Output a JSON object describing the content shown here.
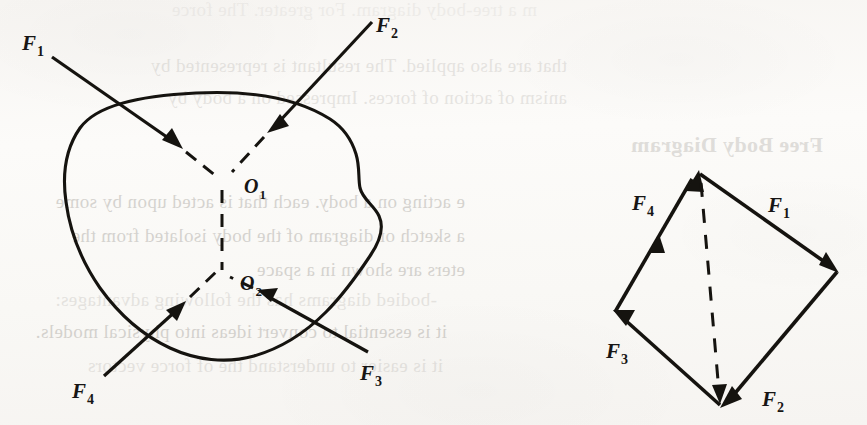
{
  "figure": {
    "kind": "physics-force-diagram",
    "panels": [
      {
        "id": "rigid-body-panel",
        "name": "non-concurrent-force-system-on-rigid-body",
        "description": "Irregular rigid body acted on by four forces meeting at two points of concurrence",
        "concurrence_points": [
          {
            "label": "O",
            "sub": "1",
            "x": 222,
            "y": 183
          },
          {
            "label": "O",
            "sub": "2",
            "x": 222,
            "y": 277
          }
        ],
        "forces": [
          {
            "label": "F",
            "sub": "1",
            "tail": [
              52,
              57
            ],
            "tip": [
              178,
              145
            ],
            "meets": "O1",
            "label_xy": [
              22,
              50
            ]
          },
          {
            "label": "F",
            "sub": "2",
            "tail": [
              372,
              22
            ],
            "tip": [
              270,
              130
            ],
            "meets": "O1",
            "label_xy": [
              376,
              32
            ]
          },
          {
            "label": "F",
            "sub": "3",
            "tail": [
              368,
              352
            ],
            "tip": [
              262,
              292
            ],
            "meets": "O2",
            "label_xy": [
              360,
              380
            ]
          },
          {
            "label": "F",
            "sub": "4",
            "tail": [
              104,
              376
            ],
            "tip": [
              182,
              305
            ],
            "meets": "O2",
            "label_xy": [
              72,
              398
            ]
          }
        ],
        "connector": {
          "style": "dashed",
          "from": "O1",
          "to": "O2"
        }
      },
      {
        "id": "force-polygon-panel",
        "name": "free-body-force-polygon",
        "description": "Closed force polygon formed by the same four force vectors placed tip to tail",
        "vertices": {
          "top": [
            698,
            172
          ],
          "right": [
            837,
            272
          ],
          "bottom": [
            720,
            405
          ],
          "left": [
            615,
            312
          ]
        },
        "forces": [
          {
            "label": "F",
            "sub": "1",
            "from": "top",
            "to": "right",
            "label_xy": [
              768,
              212
            ]
          },
          {
            "label": "F",
            "sub": "2",
            "from": "right",
            "to": "bottom",
            "label_xy": [
              762,
              406
            ]
          },
          {
            "label": "F",
            "sub": "3",
            "from": "bottom",
            "to": "left",
            "label_xy": [
              608,
              358
            ]
          },
          {
            "label": "F",
            "sub": "4",
            "from": "left",
            "to": "top",
            "label_xy": [
              634,
              210
            ]
          }
        ],
        "resultant": {
          "style": "dashed",
          "from": "top",
          "to": "bottom",
          "label": ""
        }
      }
    ],
    "colors": {
      "ink": "#15130f",
      "paper": "#fbfaf8",
      "bleed_text": "#9e9a94"
    }
  },
  "bleed_through_text": {
    "note": "faint mirrored text showing through from the reverse page",
    "heading": "Free Body Diagram",
    "lines": [
      "m a tree-body diagram. For greater. The force",
      "that are also applied. The resultant is represented by",
      "anism of action of forces. Impressed on a body by",
      "e acting on a body. each that is acted upon by some",
      "a sketch or diagram of the body isolated from the",
      "eters are shown in a space",
      "-bodied diagrams has the following advantages:",
      "it is essential to convert ideas into physical models.",
      "it is easier to understand the of force vectors"
    ]
  }
}
